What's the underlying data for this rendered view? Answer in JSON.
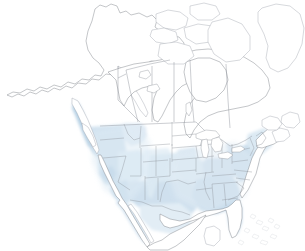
{
  "map": {
    "title": "North America Range Map",
    "projection_note": "North America, conic",
    "background_color": "#ffffff",
    "outline_color": "#8d929a",
    "range_colors": {
      "very_light": "#e8f0f7",
      "light": "#d7e5f0",
      "medium": "#c3d8e9",
      "dark": "#a9c6de",
      "coast_strip": "#a8c8df"
    },
    "legend_present": false,
    "labels_present": false,
    "regions": [
      {
        "name": "alaska",
        "shaded": false
      },
      {
        "name": "canada-north",
        "shaded": false
      },
      {
        "name": "greenland",
        "shaded": false
      },
      {
        "name": "canada-prairies",
        "shaded": false
      },
      {
        "name": "british-columbia-coast",
        "shaded": true,
        "intensity": "dark"
      },
      {
        "name": "pacific-northwest",
        "shaded": true,
        "intensity": "medium"
      },
      {
        "name": "california",
        "shaded": true,
        "intensity": "medium"
      },
      {
        "name": "great-basin",
        "shaded": true,
        "intensity": "light"
      },
      {
        "name": "southwest",
        "shaded": true,
        "intensity": "medium"
      },
      {
        "name": "great-plains",
        "shaded": true,
        "intensity": "light"
      },
      {
        "name": "midwest",
        "shaded": true,
        "intensity": "light"
      },
      {
        "name": "southeast",
        "shaded": true,
        "intensity": "medium"
      },
      {
        "name": "mid-atlantic",
        "shaded": true,
        "intensity": "medium"
      },
      {
        "name": "new-england",
        "shaded": true,
        "intensity": "light"
      },
      {
        "name": "florida",
        "shaded": true,
        "intensity": "medium"
      },
      {
        "name": "northern-mexico",
        "shaded": true,
        "intensity": "light"
      },
      {
        "name": "baja-california",
        "shaded": true,
        "intensity": "light"
      },
      {
        "name": "great-lakes",
        "shaded": false
      },
      {
        "name": "hudson-bay",
        "shaded": false
      },
      {
        "name": "bahamas",
        "shaded": false
      }
    ]
  }
}
